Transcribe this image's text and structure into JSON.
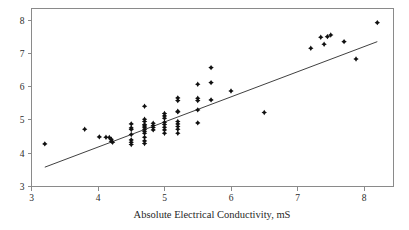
{
  "chart_data": {
    "type": "scatter",
    "title": "",
    "subtitle": "",
    "xlabel": "Absolute Electrical Conductivity, mS",
    "ylabel": "",
    "xlim": [
      3,
      8.5
    ],
    "ylim": [
      3,
      8.3
    ],
    "xticks": [
      3,
      4,
      5,
      6,
      7,
      8
    ],
    "yticks": [
      3,
      4,
      5,
      6,
      7,
      8
    ],
    "xtick_labels": [
      "3",
      "4",
      "5",
      "6",
      "7",
      "8"
    ],
    "ytick_labels": [
      "3",
      "4",
      "5",
      "6",
      "7",
      "8"
    ],
    "grid": false,
    "legend": null,
    "marker": "diamond",
    "marker_color": "#101010",
    "line_color": "#2a2a2a",
    "annotations": [],
    "series": [
      {
        "name": "observations",
        "points": [
          [
            3.2,
            4.28
          ],
          [
            3.8,
            4.72
          ],
          [
            4.02,
            4.49
          ],
          [
            4.12,
            4.48
          ],
          [
            4.17,
            4.47
          ],
          [
            4.2,
            4.42
          ],
          [
            4.2,
            4.36
          ],
          [
            4.22,
            4.33
          ],
          [
            4.5,
            4.88
          ],
          [
            4.5,
            4.76
          ],
          [
            4.5,
            4.71
          ],
          [
            4.5,
            4.56
          ],
          [
            4.5,
            4.4
          ],
          [
            4.5,
            4.33
          ],
          [
            4.5,
            4.26
          ],
          [
            4.7,
            5.41
          ],
          [
            4.7,
            5.02
          ],
          [
            4.7,
            4.95
          ],
          [
            4.7,
            4.86
          ],
          [
            4.7,
            4.82
          ],
          [
            4.7,
            4.78
          ],
          [
            4.7,
            4.72
          ],
          [
            4.7,
            4.66
          ],
          [
            4.7,
            4.6
          ],
          [
            4.7,
            4.48
          ],
          [
            4.7,
            4.37
          ],
          [
            4.7,
            4.29
          ],
          [
            4.83,
            4.9
          ],
          [
            4.83,
            4.83
          ],
          [
            4.83,
            4.77
          ],
          [
            4.83,
            4.7
          ],
          [
            5.0,
            5.19
          ],
          [
            5.0,
            5.12
          ],
          [
            5.0,
            5.05
          ],
          [
            5.0,
            4.93
          ],
          [
            5.0,
            4.86
          ],
          [
            5.0,
            4.78
          ],
          [
            5.0,
            4.7
          ],
          [
            5.0,
            4.6
          ],
          [
            5.2,
            5.66
          ],
          [
            5.2,
            5.58
          ],
          [
            5.2,
            5.26
          ],
          [
            5.2,
            5.24
          ],
          [
            5.2,
            4.95
          ],
          [
            5.2,
            4.88
          ],
          [
            5.2,
            4.8
          ],
          [
            5.2,
            4.72
          ],
          [
            5.2,
            4.6
          ],
          [
            5.5,
            6.07
          ],
          [
            5.5,
            5.65
          ],
          [
            5.5,
            5.58
          ],
          [
            5.5,
            5.3
          ],
          [
            5.5,
            4.91
          ],
          [
            5.7,
            6.57
          ],
          [
            5.7,
            6.12
          ],
          [
            5.7,
            5.6
          ],
          [
            6.0,
            5.87
          ],
          [
            6.5,
            5.22
          ],
          [
            7.2,
            7.15
          ],
          [
            7.35,
            7.48
          ],
          [
            7.4,
            7.27
          ],
          [
            7.45,
            7.5
          ],
          [
            7.5,
            7.55
          ],
          [
            7.7,
            7.35
          ],
          [
            7.88,
            6.83
          ],
          [
            8.2,
            7.92
          ]
        ]
      }
    ],
    "fit_line": {
      "name": "least-squares fit",
      "x_start": 3.2,
      "y_start": 3.58,
      "x_end": 8.2,
      "y_end": 7.35,
      "slope": 0.754,
      "intercept": 1.167
    }
  },
  "axes": {
    "x_title": "Absolute Electrical Conductivity, mS"
  }
}
